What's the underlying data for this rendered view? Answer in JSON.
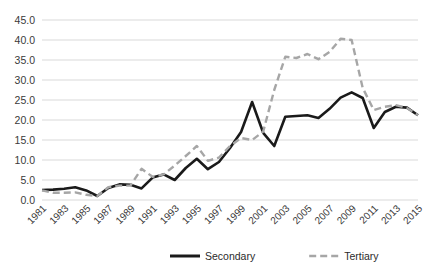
{
  "chart_data": {
    "type": "line",
    "title": "",
    "subtitle": "",
    "xlabel": "",
    "ylabel": "",
    "grid": true,
    "legend_position": "bottom",
    "ylim": [
      0.0,
      45.0
    ],
    "ytick_labels": [
      "45.0",
      "40.0",
      "35.0",
      "30.0",
      "25.0",
      "20.0",
      "15.0",
      "10.0",
      "5.0",
      "0.0"
    ],
    "ytick_values": [
      45.0,
      40.0,
      35.0,
      30.0,
      25.0,
      20.0,
      15.0,
      10.0,
      5.0,
      0.0
    ],
    "x": [
      1981,
      1982,
      1983,
      1984,
      1985,
      1986,
      1987,
      1988,
      1989,
      1990,
      1991,
      1992,
      1993,
      1994,
      1995,
      1996,
      1997,
      1998,
      1999,
      2000,
      2001,
      2002,
      2003,
      2004,
      2005,
      2006,
      2007,
      2008,
      2009,
      2010,
      2011,
      2012,
      2013,
      2014,
      2015
    ],
    "xtick_labels": [
      "1981",
      "1983",
      "1985",
      "1987",
      "1989",
      "1991",
      "1993",
      "1995",
      "1997",
      "1999",
      "2001",
      "2003",
      "2005",
      "2007",
      "2009",
      "2011",
      "2013",
      "2015"
    ],
    "xtick_values": [
      1981,
      1983,
      1985,
      1987,
      1989,
      1991,
      1993,
      1995,
      1997,
      1999,
      2001,
      2003,
      2005,
      2007,
      2009,
      2011,
      2013,
      2015
    ],
    "xtick_rotation": 45,
    "series": [
      {
        "name": "Secondary",
        "color": "#1a1a1a",
        "style": "solid",
        "width": 2.6,
        "values": [
          2.5,
          2.6,
          2.8,
          3.2,
          2.4,
          1.0,
          3.0,
          3.9,
          3.8,
          2.9,
          5.6,
          6.4,
          5.0,
          8.0,
          10.3,
          7.7,
          9.5,
          13.0,
          17.0,
          24.5,
          16.8,
          13.5,
          20.8,
          21.0,
          21.2,
          20.5,
          22.8,
          25.6,
          26.9,
          25.5,
          18.0,
          22.0,
          23.3,
          23.1,
          21.2
        ]
      },
      {
        "name": "Tertiary",
        "color": "#a6a6a6",
        "style": "dashed",
        "width": 2.4,
        "values": [
          2.4,
          1.8,
          1.8,
          1.9,
          1.3,
          1.0,
          3.2,
          3.6,
          3.6,
          7.8,
          5.8,
          6.4,
          8.6,
          11.0,
          13.5,
          9.8,
          10.6,
          13.5,
          15.5,
          15.0,
          17.1,
          27.5,
          35.8,
          35.5,
          36.5,
          35.2,
          37.0,
          40.3,
          40.0,
          28.0,
          22.5,
          23.3,
          23.7,
          23.0,
          21.2
        ]
      }
    ],
    "legend": [
      {
        "label": "Secondary",
        "color": "#1a1a1a",
        "style": "solid"
      },
      {
        "label": "Tertiary",
        "color": "#a6a6a6",
        "style": "dashed"
      }
    ]
  }
}
